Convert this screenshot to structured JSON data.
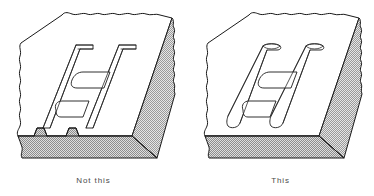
{
  "figure": {
    "panels": [
      {
        "id": "not-this",
        "caption": "Not this",
        "icon": "block-with-square-ended-h-groove-icon",
        "description": "Isometric block with H-shaped groove having square ends that break through the front edge"
      },
      {
        "id": "this",
        "caption": "This",
        "icon": "block-with-round-ended-h-groove-icon",
        "description": "Isometric block with H-shaped groove having rounded ends stopping short of the front edge"
      }
    ]
  },
  "colors": {
    "line": "#1a1a1a",
    "top_face": "#ffffff",
    "shaded_face": "#bdbdbd",
    "front_face": "#bdbdbd",
    "background": "#ffffff",
    "caption_text": "#4a4a4a"
  }
}
